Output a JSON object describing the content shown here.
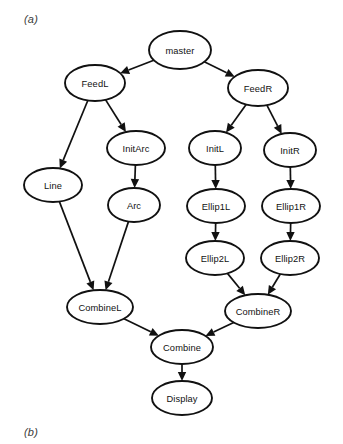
{
  "figure": {
    "caption_a": "(a)",
    "caption_b": "(b)",
    "background_color": "#ffffff",
    "stroke_color": "#111111"
  },
  "chart_data": {
    "type": "diagram",
    "title": "",
    "diagram_kind": "directed-acyclic-graph",
    "node_shape": "ellipse",
    "nodes": [
      {
        "id": "master",
        "label": "master",
        "cx": 180,
        "cy": 50,
        "rx": 31,
        "ry": 19
      },
      {
        "id": "FeedL",
        "label": "FeedL",
        "cx": 95,
        "cy": 83,
        "rx": 30,
        "ry": 18
      },
      {
        "id": "FeedR",
        "label": "FeedR",
        "cx": 258,
        "cy": 88,
        "rx": 30,
        "ry": 18
      },
      {
        "id": "InitArc",
        "label": "InitArc",
        "cx": 136,
        "cy": 148,
        "rx": 29,
        "ry": 17
      },
      {
        "id": "InitL",
        "label": "InitL",
        "cx": 215,
        "cy": 148,
        "rx": 26,
        "ry": 17
      },
      {
        "id": "InitR",
        "label": "InitR",
        "cx": 290,
        "cy": 150,
        "rx": 26,
        "ry": 17
      },
      {
        "id": "Line",
        "label": "Line",
        "cx": 53,
        "cy": 185,
        "rx": 29,
        "ry": 17
      },
      {
        "id": "Arc",
        "label": "Arc",
        "cx": 134,
        "cy": 205,
        "rx": 26,
        "ry": 17
      },
      {
        "id": "Ellip1L",
        "label": "Ellip1L",
        "cx": 216,
        "cy": 206,
        "rx": 29,
        "ry": 17
      },
      {
        "id": "Ellip1R",
        "label": "Ellip1R",
        "cx": 291,
        "cy": 206,
        "rx": 29,
        "ry": 17
      },
      {
        "id": "Ellip2L",
        "label": "Ellip2L",
        "cx": 215,
        "cy": 258,
        "rx": 29,
        "ry": 17
      },
      {
        "id": "Ellip2R",
        "label": "Ellip2R",
        "cx": 290,
        "cy": 258,
        "rx": 29,
        "ry": 17
      },
      {
        "id": "CombineL",
        "label": "CombineL",
        "cx": 100,
        "cy": 307,
        "rx": 33,
        "ry": 17
      },
      {
        "id": "CombineR",
        "label": "CombineR",
        "cx": 258,
        "cy": 311,
        "rx": 33,
        "ry": 17
      },
      {
        "id": "Combine",
        "label": "Combine",
        "cx": 182,
        "cy": 347,
        "rx": 31,
        "ry": 17
      },
      {
        "id": "Display",
        "label": "Display",
        "cx": 182,
        "cy": 398,
        "rx": 30,
        "ry": 17
      }
    ],
    "edges": [
      {
        "from": "master",
        "to": "FeedL"
      },
      {
        "from": "master",
        "to": "FeedR"
      },
      {
        "from": "FeedL",
        "to": "Line"
      },
      {
        "from": "FeedL",
        "to": "InitArc"
      },
      {
        "from": "FeedR",
        "to": "InitL"
      },
      {
        "from": "FeedR",
        "to": "InitR"
      },
      {
        "from": "InitArc",
        "to": "Arc"
      },
      {
        "from": "InitL",
        "to": "Ellip1L"
      },
      {
        "from": "InitR",
        "to": "Ellip1R"
      },
      {
        "from": "Ellip1L",
        "to": "Ellip2L"
      },
      {
        "from": "Ellip1R",
        "to": "Ellip2R"
      },
      {
        "from": "Line",
        "to": "CombineL"
      },
      {
        "from": "Arc",
        "to": "CombineL"
      },
      {
        "from": "Ellip2L",
        "to": "CombineR"
      },
      {
        "from": "Ellip2R",
        "to": "CombineR"
      },
      {
        "from": "CombineL",
        "to": "Combine"
      },
      {
        "from": "CombineR",
        "to": "Combine"
      },
      {
        "from": "Combine",
        "to": "Display"
      }
    ]
  }
}
